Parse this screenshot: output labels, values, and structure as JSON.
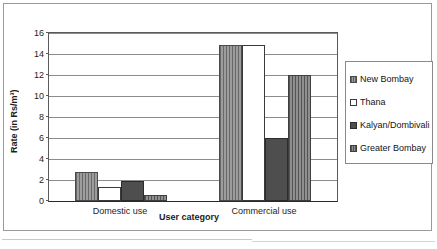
{
  "chart_data": {
    "type": "bar",
    "title": "",
    "xlabel": "User category",
    "ylabel": "Rate (in Rs/m³)",
    "categories": [
      "Domestic use",
      "Commercial use"
    ],
    "series": [
      {
        "name": "New Bombay",
        "values": [
          2.8,
          14.9
        ]
      },
      {
        "name": "Thana",
        "values": [
          1.3,
          14.9
        ]
      },
      {
        "name": "Kalyan/Dombivali",
        "values": [
          1.9,
          6.0
        ]
      },
      {
        "name": "Greater Bombay",
        "values": [
          0.55,
          12.0
        ]
      }
    ],
    "ylim": [
      0,
      16
    ],
    "yticks": [
      0,
      2,
      4,
      6,
      8,
      10,
      12,
      14,
      16
    ],
    "ytick_labels": [
      "0",
      "2",
      "4",
      "6",
      "8",
      "10",
      "12",
      "14",
      "16"
    ],
    "grid": true,
    "legend_position": "right",
    "colors": {
      "new_bombay": "#9d9d9d",
      "thana": "#ffffff",
      "kalyan": "#4e4e4e",
      "greater_bombay": "#8f8f8f",
      "axis": "#2a2a2a",
      "gridline": "#8c8c8c",
      "frame": "#9a9a9a"
    }
  }
}
